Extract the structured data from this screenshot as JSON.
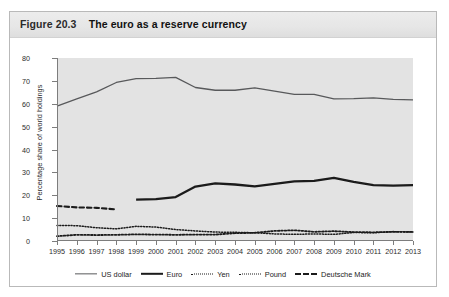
{
  "figure": {
    "number": "Figure 20.3",
    "title": "The euro as a reserve currency"
  },
  "colors": {
    "card_background": "#ffffff",
    "title_band": "#e8e8e8",
    "plot_background": "#e3e3e3",
    "axis": "#7d7d7d",
    "us_dollar": "#58595b",
    "euro": "#1b1b1b",
    "yen": "#1b1b1b",
    "pound": "#1b1b1b",
    "deutsche_mark": "#1b1b1b"
  },
  "chart_data": {
    "type": "line",
    "title": "The euro as a reserve currency",
    "xlabel": "",
    "ylabel": "Percentage share of world holdings",
    "xlim": [
      1995,
      2013
    ],
    "ylim": [
      0,
      80
    ],
    "yticks": [
      0,
      10,
      20,
      30,
      40,
      50,
      60,
      70,
      80
    ],
    "grid": false,
    "legend_position": "bottom",
    "x": [
      1995,
      1996,
      1997,
      1998,
      1999,
      2000,
      2001,
      2002,
      2003,
      2004,
      2005,
      2006,
      2007,
      2008,
      2009,
      2010,
      2011,
      2012,
      2013
    ],
    "categories": [
      "1995",
      "1996",
      "1997",
      "1998",
      "1999",
      "2000",
      "2001",
      "2002",
      "2003",
      "2004",
      "2005",
      "2006",
      "2007",
      "2008",
      "2009",
      "2010",
      "2011",
      "2012",
      "2013"
    ],
    "series": [
      {
        "name": "US dollar",
        "style": "solid-thin",
        "color": "#58595b",
        "values": [
          59.0,
          62.1,
          65.2,
          69.3,
          71.0,
          71.1,
          71.5,
          67.1,
          65.9,
          65.9,
          66.9,
          65.5,
          64.1,
          64.1,
          62.1,
          62.2,
          62.6,
          61.9,
          61.7
        ]
      },
      {
        "name": "Euro",
        "style": "solid-thick",
        "color": "#1b1b1b",
        "values": [
          null,
          null,
          null,
          null,
          18.1,
          18.3,
          19.2,
          23.8,
          25.2,
          24.7,
          23.9,
          25.0,
          26.1,
          26.3,
          27.6,
          25.8,
          24.4,
          24.2,
          24.4
        ]
      },
      {
        "name": "Yen",
        "style": "fine-dotted",
        "color": "#1b1b1b",
        "values": [
          6.8,
          6.7,
          5.8,
          5.3,
          6.4,
          6.1,
          5.0,
          4.4,
          3.9,
          3.8,
          3.6,
          3.1,
          2.9,
          3.1,
          2.9,
          3.7,
          3.6,
          4.1,
          3.9
        ]
      },
      {
        "name": "Pound",
        "style": "dotted",
        "color": "#1b1b1b",
        "values": [
          2.1,
          2.7,
          2.6,
          2.7,
          2.9,
          2.8,
          2.7,
          2.8,
          2.8,
          3.4,
          3.6,
          4.4,
          4.7,
          4.0,
          4.3,
          3.9,
          3.8,
          4.0,
          4.0
        ]
      },
      {
        "name": "Deutsche Mark",
        "style": "dashed",
        "color": "#1b1b1b",
        "values": [
          15.3,
          14.7,
          14.5,
          13.8,
          null,
          null,
          null,
          null,
          null,
          null,
          null,
          null,
          null,
          null,
          null,
          null,
          null,
          null,
          null
        ]
      }
    ]
  },
  "legend": {
    "items": [
      {
        "label": "US dollar",
        "style": "sw-thin"
      },
      {
        "label": "Euro",
        "style": "sw-thick"
      },
      {
        "label": "Yen",
        "style": "sw-fine"
      },
      {
        "label": "Pound",
        "style": "sw-dot"
      },
      {
        "label": "Deutsche Mark",
        "style": "sw-dash"
      }
    ]
  }
}
